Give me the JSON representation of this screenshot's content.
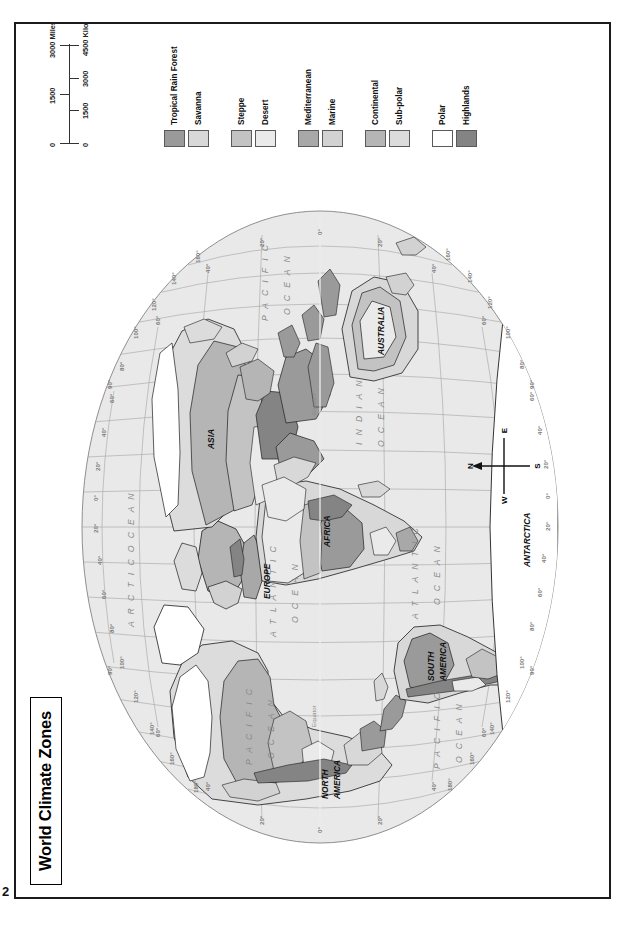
{
  "page": {
    "number": "2",
    "title": "World Climate Zones"
  },
  "scale": {
    "miles_unit": "3000 Miles",
    "km_unit": "4500 Kilometers",
    "miles_ticks": [
      "0",
      "1500",
      "3000"
    ],
    "km_ticks": [
      "0",
      "1500",
      "3000",
      "4500"
    ]
  },
  "compass": {
    "n": "N",
    "s": "S",
    "e": "E",
    "w": "W"
  },
  "legend": {
    "groups": [
      {
        "items": [
          {
            "label": "Tropical Rain Forest",
            "color": "#9a9a9a"
          },
          {
            "label": "Savanna",
            "color": "#d8d8d8"
          }
        ]
      },
      {
        "items": [
          {
            "label": "Steppe",
            "color": "#c3c3c3"
          },
          {
            "label": "Desert",
            "color": "#eaeaea"
          }
        ]
      },
      {
        "items": [
          {
            "label": "Mediterranean",
            "color": "#a8a8a8"
          },
          {
            "label": "Marine",
            "color": "#d2d2d2"
          }
        ]
      },
      {
        "items": [
          {
            "label": "Continental",
            "color": "#b5b5b5"
          },
          {
            "label": "Sub-polar",
            "color": "#dcdcdc"
          }
        ]
      },
      {
        "items": [
          {
            "label": "Polar",
            "color": "#ffffff"
          },
          {
            "label": "Highlands",
            "color": "#848484"
          }
        ]
      }
    ]
  },
  "map": {
    "oceans": [
      "PACIFIC OCEAN",
      "ATLANTIC OCEAN",
      "INDIAN OCEAN",
      "ARCTIC OCEAN",
      "PACIFIC OCEAN",
      "ATLANTIC OCEAN"
    ],
    "continents": [
      "NORTH AMERICA",
      "SOUTH AMERICA",
      "EUROPE",
      "AFRICA",
      "ASIA",
      "AUSTRALIA",
      "ANTARCTICA"
    ],
    "equator_label": "Equator",
    "longitude_labels": [
      "180°",
      "160°",
      "140°",
      "120°",
      "100°",
      "80°",
      "60°",
      "40°",
      "20°",
      "0°",
      "20°",
      "40°",
      "60°",
      "80°",
      "100°",
      "120°",
      "140°",
      "160°",
      "180°"
    ],
    "latitude_labels": [
      "90°",
      "60°",
      "40°",
      "20°",
      "0°",
      "20°",
      "40°",
      "60°",
      "90°"
    ],
    "colors": {
      "ocean": "#e9e9e9",
      "graticule": "#a9a9a9",
      "coast": "#1d1d1d",
      "tropical_rain_forest": "#9a9a9a",
      "savanna": "#d8d8d8",
      "steppe": "#c3c3c3",
      "desert": "#eaeaea",
      "mediterranean": "#a8a8a8",
      "marine": "#d2d2d2",
      "continental": "#b5b5b5",
      "subpolar": "#dcdcdc",
      "polar": "#ffffff",
      "highlands": "#848484"
    }
  }
}
